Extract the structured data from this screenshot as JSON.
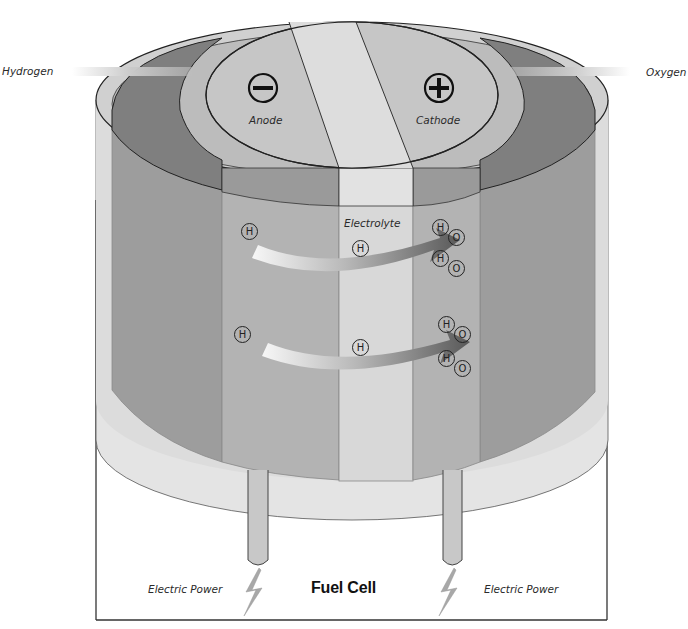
{
  "diagram": {
    "title": "Fuel Cell",
    "inputs": {
      "left_gas": "Hydrogen",
      "right_gas": "Oxygen"
    },
    "electrodes": {
      "anode": {
        "label": "Anode",
        "polarity_symbol": "minus-icon"
      },
      "cathode": {
        "label": "Cathode",
        "polarity_symbol": "plus-icon"
      }
    },
    "electrolyte_label": "Electrolyte",
    "outputs": {
      "left_power": "Electric Power",
      "right_power": "Electric Power"
    },
    "particles": {
      "hydrogen_symbol": "H",
      "oxygen_symbol": "O",
      "anode_hydrogen_count": 2,
      "electrolyte_hydrogen_count": 2,
      "cathode_water_pairs": 4
    },
    "colors": {
      "background": "#ffffff",
      "outer_shell": "#e4e4e4",
      "outer_wall_dark": "#9d9d9d",
      "gas_chamber": "#7f7f7f",
      "electrode": "#b3b3b3",
      "electrode_top": "#c6c6c6",
      "electrolyte": "#d8d8d8",
      "arrow_start": "#f4f4f4",
      "arrow_end": "#5e5e5e",
      "outline": "#222222"
    }
  }
}
